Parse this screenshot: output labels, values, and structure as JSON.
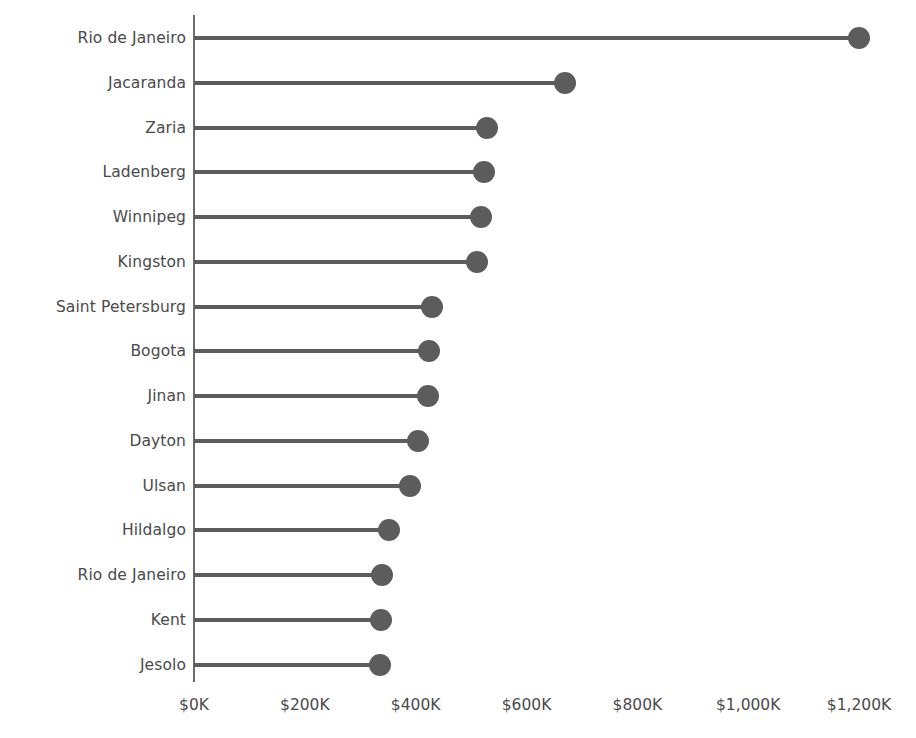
{
  "chart_data": {
    "type": "bar",
    "subtype": "lollipop-horizontal",
    "title": "",
    "xlabel": "",
    "ylabel": "",
    "categories": [
      "Rio de Janeiro",
      "Jacaranda",
      "Zaria",
      "Ladenberg",
      "Winnipeg",
      "Kingston",
      "Saint Petersburg",
      "Bogota",
      "Jinan",
      "Dayton",
      "Ulsan",
      "Hildalgo",
      "Rio de Janeiro",
      "Kent",
      "Jesolo"
    ],
    "values": [
      1200,
      670,
      528,
      524,
      518,
      511,
      429,
      424,
      423,
      404,
      390,
      351,
      340,
      337,
      335
    ],
    "value_unit": "$K",
    "xlim": [
      0,
      1260
    ],
    "x_ticks": [
      0,
      200,
      400,
      600,
      800,
      1000,
      1200
    ],
    "x_tick_labels": [
      "$0K",
      "$200K",
      "$400K",
      "$600K",
      "$800K",
      "$1,000K",
      "$1,200K"
    ],
    "grid": false,
    "legend": null,
    "series_color": "#5c5c5c",
    "axis_color": "#6b6b6b",
    "text_color": "#4a4a4a"
  }
}
